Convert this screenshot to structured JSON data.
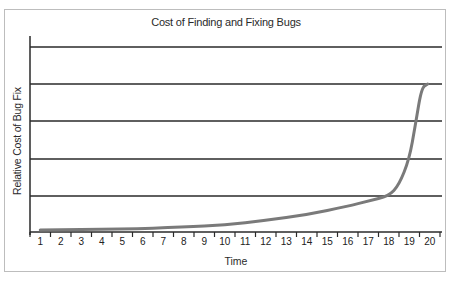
{
  "chart_data": {
    "type": "line",
    "title": "Cost of Finding and Fixing Bugs",
    "xlabel": "Time",
    "ylabel": "Relative Cost of Bug Fix",
    "categories": [
      "1",
      "2",
      "3",
      "4",
      "5",
      "6",
      "7",
      "8",
      "9",
      "10",
      "11",
      "12",
      "13",
      "14",
      "15",
      "16",
      "17",
      "18",
      "19",
      "20"
    ],
    "y_ticks_labeled": false,
    "grid": "horizontal",
    "gridline_count": 5,
    "ylim": [
      0,
      5
    ],
    "series": [
      {
        "name": "Relative Cost of Bug Fix",
        "color": "#7a7a7a",
        "x": [
          1,
          5,
          8,
          10,
          12,
          14,
          16,
          17,
          18,
          18.5,
          19,
          19.3,
          19.6,
          19.9
        ],
        "values": [
          0.0,
          0.03,
          0.08,
          0.15,
          0.28,
          0.45,
          0.7,
          0.85,
          1.0,
          1.3,
          2.0,
          2.9,
          3.9,
          4.0
        ]
      }
    ],
    "legend": null
  },
  "colors": {
    "axis": "#2a2a2a",
    "grid": "#2a2a2a",
    "curve": "#7a7a7a",
    "frame": "#bdbdbd"
  }
}
